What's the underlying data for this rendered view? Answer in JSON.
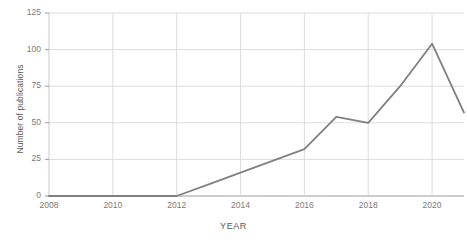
{
  "chart_data": {
    "type": "line",
    "title": "",
    "xlabel": "YEAR",
    "ylabel": "Number of publications",
    "x": [
      2008,
      2009,
      2010,
      2011,
      2012,
      2013,
      2014,
      2015,
      2016,
      2017,
      2018,
      2019,
      2020,
      2021
    ],
    "values": [
      0,
      0,
      0,
      0,
      0,
      8,
      16,
      24,
      32,
      54,
      50,
      75,
      104,
      57
    ],
    "series": [
      {
        "name": "Number of publications",
        "values": [
          0,
          0,
          0,
          0,
          0,
          8,
          16,
          24,
          32,
          54,
          50,
          75,
          104,
          57
        ]
      }
    ],
    "xlim": [
      2008,
      2021
    ],
    "ylim": [
      0,
      125
    ],
    "xticks": [
      2008,
      2010,
      2012,
      2014,
      2016,
      2018,
      2020
    ],
    "xtick_labels": [
      "2008",
      "2010",
      "2012",
      "2014",
      "2016",
      "2018",
      "2020"
    ],
    "yticks": [
      0,
      25,
      50,
      75,
      100,
      125
    ],
    "ytick_labels": [
      "0",
      "25",
      "50",
      "75",
      "100",
      "125"
    ],
    "grid": true,
    "legend": "none",
    "line_color": "#808080",
    "grid_color": "#dcdcdc",
    "axis_color": "#9a9a9a",
    "background": "#ffffff"
  }
}
